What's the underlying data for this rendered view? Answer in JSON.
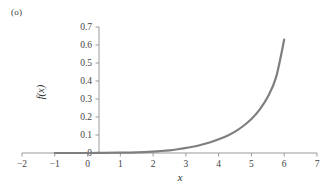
{
  "figure": {
    "panel_label": "(o)",
    "background_color": "#ffffff"
  },
  "chart_data": {
    "type": "line",
    "title": "",
    "subtitle": "",
    "xlabel": "x",
    "ylabel": "f(x)",
    "xlim": [
      -2,
      7
    ],
    "ylim": [
      0,
      0.7
    ],
    "xticks": [
      -2,
      -1,
      0,
      1,
      2,
      3,
      4,
      5,
      6,
      7
    ],
    "xtick_labels": [
      "-2",
      "-1",
      "0",
      "1",
      "2",
      "3",
      "4",
      "5",
      "6",
      "7"
    ],
    "yticks": [
      0,
      0.1,
      0.2,
      0.3,
      0.4,
      0.5,
      0.6,
      0.7
    ],
    "ytick_labels": [
      "0",
      "0.1",
      "0.2",
      "0.3",
      "0.4",
      "0.5",
      "0.6",
      "0.7"
    ],
    "grid": false,
    "legend": null,
    "legend_position": "none",
    "series": [
      {
        "name": "f(x)",
        "color": "#7f7f7f",
        "line_width": 2.2,
        "marker": "none",
        "x": [
          -1.0,
          -0.5,
          0.0,
          0.5,
          1.0,
          1.5,
          2.0,
          2.25,
          2.5,
          2.75,
          3.0,
          3.25,
          3.5,
          3.75,
          4.0,
          4.25,
          4.5,
          4.75,
          5.0,
          5.25,
          5.5,
          5.75,
          6.0
        ],
        "values": [
          0.0,
          0.0,
          0.0,
          0.001,
          0.002,
          0.004,
          0.008,
          0.011,
          0.015,
          0.021,
          0.028,
          0.036,
          0.047,
          0.06,
          0.076,
          0.095,
          0.119,
          0.15,
          0.189,
          0.241,
          0.312,
          0.42,
          0.63
        ]
      }
    ]
  },
  "axes_style": {
    "axis_color": "#9a9a9a",
    "tick_color": "#9a9a9a",
    "text_color": "#3f3f3f"
  }
}
